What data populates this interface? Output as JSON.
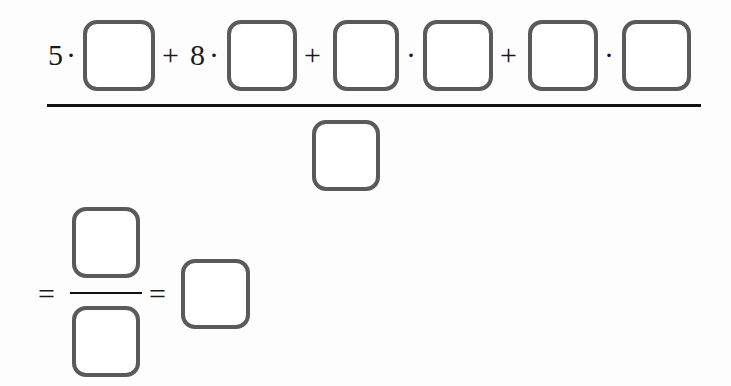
{
  "numerator": {
    "terms": [
      {
        "coefficient": "5",
        "op": "·",
        "blank": ""
      },
      {
        "plus": "+",
        "coefficient": "8",
        "op": "·",
        "blank": ""
      },
      {
        "plus": "+",
        "blank_a": "",
        "op": "·",
        "blank_b": ""
      },
      {
        "plus": "+",
        "blank_a": "",
        "op": "·",
        "blank_b": ""
      }
    ]
  },
  "denominator": {
    "blank": ""
  },
  "result_line": {
    "equals_1": "=",
    "fraction_numerator": "",
    "fraction_denominator": "",
    "equals_2": "=",
    "final_answer": ""
  },
  "colors": {
    "box_border": "#5a5a5a",
    "rule": "#111111",
    "background": "#fdfdfd"
  }
}
